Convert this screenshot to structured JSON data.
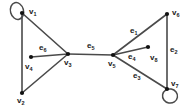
{
  "diagram": {
    "background_color": "#ffffff",
    "edge_color": "#4a4a4a",
    "vertex_color": "#111111",
    "label_color": "#1a1a1a",
    "width": 188,
    "height": 108
  },
  "vertices": [
    {
      "id": "v1",
      "label": "v",
      "sub": "1",
      "x": 22,
      "y": 13,
      "label_x": 29,
      "label_y": 8,
      "has_loop": true,
      "shape": "dot"
    },
    {
      "id": "v2",
      "label": "v",
      "sub": "2",
      "x": 22,
      "y": 93,
      "label_x": 17,
      "label_y": 97,
      "has_loop": false,
      "shape": "dot"
    },
    {
      "id": "v3",
      "label": "v",
      "sub": "3",
      "x": 68,
      "y": 54,
      "label_x": 64,
      "label_y": 59,
      "has_loop": false,
      "shape": "dot"
    },
    {
      "id": "v4",
      "label": "v",
      "sub": "4",
      "x": 31,
      "y": 57,
      "label_x": 25,
      "label_y": 63,
      "has_loop": false,
      "shape": "dot"
    },
    {
      "id": "v5",
      "label": "v",
      "sub": "5",
      "x": 113,
      "y": 55,
      "label_x": 108,
      "label_y": 60,
      "has_loop": false,
      "shape": "dot"
    },
    {
      "id": "v6",
      "label": "v",
      "sub": "6",
      "x": 167,
      "y": 14,
      "label_x": 172,
      "label_y": 9,
      "has_loop": false,
      "shape": "dot"
    },
    {
      "id": "v7",
      "label": "v",
      "sub": "7",
      "x": 167,
      "y": 89,
      "label_x": 171,
      "label_y": 80,
      "has_loop": true,
      "shape": "dot"
    },
    {
      "id": "v8",
      "label": "v",
      "sub": "8",
      "x": 148,
      "y": 47,
      "label_x": 150,
      "label_y": 54,
      "has_loop": false,
      "shape": "dot"
    }
  ],
  "edges": [
    {
      "id": "e1",
      "label": "e",
      "sub": "1",
      "from": "v5",
      "to": "v6",
      "labeled": true,
      "label_x": 130,
      "label_y": 27
    },
    {
      "id": "e2",
      "label": "e",
      "sub": "2",
      "from": "v6",
      "to": "v7",
      "labeled": true,
      "label_x": 170,
      "label_y": 46
    },
    {
      "id": "e3",
      "label": "e",
      "sub": "3",
      "from": "v5",
      "to": "v7",
      "labeled": true,
      "label_x": 133,
      "label_y": 72
    },
    {
      "id": "e4",
      "label": "e",
      "sub": "4",
      "from": "v5",
      "to": "v8",
      "labeled": true,
      "label_x": 128,
      "label_y": 53
    },
    {
      "id": "e5",
      "label": "e",
      "sub": "5",
      "from": "v3",
      "to": "v5",
      "labeled": true,
      "label_x": 87,
      "label_y": 42
    },
    {
      "id": "e6",
      "label": "e",
      "sub": "6",
      "from": "v4",
      "to": "v3",
      "labeled": true,
      "label_x": 39,
      "label_y": 44
    },
    {
      "id": "e7",
      "label": "",
      "sub": "",
      "from": "v1",
      "to": "v2",
      "labeled": false,
      "label_x": 0,
      "label_y": 0
    },
    {
      "id": "e8",
      "label": "",
      "sub": "",
      "from": "v1",
      "to": "v3",
      "labeled": false,
      "label_x": 0,
      "label_y": 0
    },
    {
      "id": "e9",
      "label": "",
      "sub": "",
      "from": "v2",
      "to": "v3",
      "labeled": false,
      "label_x": 0,
      "label_y": 0
    }
  ],
  "loops": [
    {
      "id": "loop-v1",
      "at": "v1",
      "cx": 17,
      "cy": 11,
      "rx": 6.5,
      "ry": 8.5,
      "rotation": -15
    },
    {
      "id": "loop-v7",
      "at": "v7",
      "cx": 170,
      "cy": 96,
      "rx": 7.5,
      "ry": 7.0,
      "rotation": 10
    }
  ]
}
